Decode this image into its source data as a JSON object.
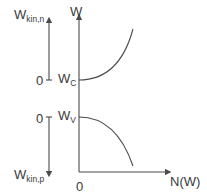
{
  "diagram": {
    "left_axis": {
      "top_label_main": "W",
      "top_label_sub": "kin,n",
      "bottom_label_main": "W",
      "bottom_label_sub": "kin,p",
      "upper_zero": "0",
      "lower_zero": "0"
    },
    "main_axis": {
      "y_label": "W",
      "x_label": "N(W)",
      "origin_label": "0",
      "conduction_label_main": "W",
      "conduction_label_sub": "C",
      "valence_label_main": "W",
      "valence_label_sub": "V"
    },
    "colors": {
      "line": "#4a4a4a",
      "text": "#3a3a3a",
      "background": "#ffffff"
    }
  }
}
